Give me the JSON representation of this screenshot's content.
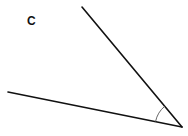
{
  "diagram": {
    "type": "angle",
    "label": "C",
    "label_position": {
      "x": 27,
      "y": 15
    },
    "vertex": {
      "x": 182,
      "y": 127
    },
    "rays": [
      {
        "name": "upper-ray",
        "end": {
          "x": 82,
          "y": 7
        }
      },
      {
        "name": "lower-ray",
        "end": {
          "x": 8,
          "y": 92
        }
      }
    ],
    "arc": {
      "radius": 27,
      "color": "#555555"
    },
    "line_color": "#111111",
    "line_width": 1.6,
    "background": "#ffffff"
  }
}
